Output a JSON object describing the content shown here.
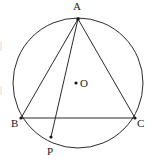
{
  "figure": {
    "kind": "geometry-diagram",
    "background_color": "#ffffff",
    "stroke_color": "#2b2b2b",
    "label_color": "#1a1a1a",
    "stroke_width": 1,
    "canvas": {
      "width": 152,
      "height": 163
    }
  },
  "circle": {
    "name": "circumcircle",
    "center": {
      "x": 78,
      "y": 83
    },
    "radius": 65,
    "fill": "none",
    "stroke": "#2b2b2b"
  },
  "center_point": {
    "label": "O",
    "dot_x": 76,
    "dot_y": 83,
    "dot_radius": 1.6,
    "label_x": 80,
    "label_y": 78
  },
  "points": [
    {
      "id": "A",
      "label": "A",
      "x": 78,
      "y": 19,
      "label_x": 73,
      "label_y": 1,
      "dot": true,
      "dot_radius": 1.8,
      "on_circle": true
    },
    {
      "id": "B",
      "label": "B",
      "x": 21,
      "y": 118,
      "label_x": 11,
      "label_y": 118,
      "dot": true,
      "dot_radius": 1.6,
      "on_circle": true
    },
    {
      "id": "C",
      "label": "C",
      "x": 135,
      "y": 118,
      "label_x": 137,
      "label_y": 118,
      "dot": true,
      "dot_radius": 1.6,
      "on_circle": true
    },
    {
      "id": "P",
      "label": "P",
      "x": 51,
      "y": 137,
      "label_x": 47,
      "label_y": 146,
      "dot": true,
      "dot_radius": 1.6,
      "on_circle": true
    }
  ],
  "segments": [
    {
      "id": "AB",
      "from": "A",
      "to": "B",
      "x1": 78,
      "y1": 19,
      "x2": 21,
      "y2": 118,
      "stroke": "#2b2b2b"
    },
    {
      "id": "AC",
      "from": "A",
      "to": "C",
      "x1": 78,
      "y1": 19,
      "x2": 135,
      "y2": 118,
      "stroke": "#2b2b2b"
    },
    {
      "id": "BC",
      "from": "B",
      "to": "C",
      "x1": 21,
      "y1": 118,
      "x2": 135,
      "y2": 118,
      "stroke": "#2b2b2b"
    },
    {
      "id": "AP",
      "from": "A",
      "to": "P",
      "x1": 78,
      "y1": 19,
      "x2": 51,
      "y2": 137,
      "stroke": "#2b2b2b"
    }
  ],
  "edge_text_fragments": [
    {
      "id": "frag-top",
      "text": "|",
      "x": 0,
      "y": 41
    },
    {
      "id": "frag-mid",
      "text": "|",
      "x": 0,
      "y": 85
    }
  ]
}
